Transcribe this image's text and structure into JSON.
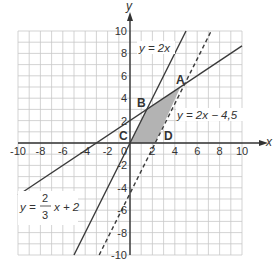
{
  "axes": {
    "x_label": "x",
    "y_label": "y",
    "x_ticks": [
      "-10",
      "-8",
      "-6",
      "-4",
      "-2",
      "2",
      "4",
      "6",
      "8",
      "10"
    ],
    "y_ticks": [
      "10",
      "8",
      "6",
      "4",
      "2",
      "-2",
      "-4",
      "-6",
      "-8",
      "-10"
    ],
    "origin_label": "0",
    "range": [
      -10,
      10
    ]
  },
  "lines": [
    {
      "equation": "y = 2x",
      "style": "solid"
    },
    {
      "equation": "y = 2x − 4,5",
      "style": "dashed"
    },
    {
      "equation_y": "y =",
      "frac_num": "2",
      "frac_den": "3",
      "equation_rest": "x + 2",
      "style": "solid"
    }
  ],
  "points": [
    {
      "label": "A",
      "x": 4.5,
      "y": 5
    },
    {
      "label": "B",
      "x": 1.5,
      "y": 3
    },
    {
      "label": "C",
      "x": 0,
      "y": 0
    },
    {
      "label": "D",
      "x": 2.25,
      "y": 0
    }
  ],
  "shaded_region": {
    "vertices": [
      "C",
      "B",
      "A",
      "D"
    ],
    "color": "#b3b3b3"
  },
  "colors": {
    "grid": "#c8c8c8",
    "axis": "#333333",
    "line": "#3a3a3a",
    "shade": "#b3b3b3"
  },
  "chart_data": {
    "type": "line",
    "title": "",
    "xlabel": "x",
    "ylabel": "y",
    "xlim": [
      -10,
      10
    ],
    "ylim": [
      -10,
      10
    ],
    "grid": true,
    "series": [
      {
        "name": "y = 2x",
        "slope": 2,
        "intercept": 0,
        "style": "solid"
      },
      {
        "name": "y = 2x - 4,5",
        "slope": 2,
        "intercept": -4.5,
        "style": "dashed"
      },
      {
        "name": "y = 2/3 x + 2",
        "slope": 0.6667,
        "intercept": 2,
        "style": "solid"
      }
    ],
    "points": [
      {
        "label": "A",
        "x": 4.5,
        "y": 5
      },
      {
        "label": "B",
        "x": 1.5,
        "y": 3
      },
      {
        "label": "C",
        "x": 0,
        "y": 0
      },
      {
        "label": "D",
        "x": 2.25,
        "y": 0
      }
    ],
    "shaded_polygon": [
      [
        0,
        0
      ],
      [
        1.5,
        3
      ],
      [
        4.5,
        5
      ],
      [
        2.25,
        0
      ]
    ]
  }
}
